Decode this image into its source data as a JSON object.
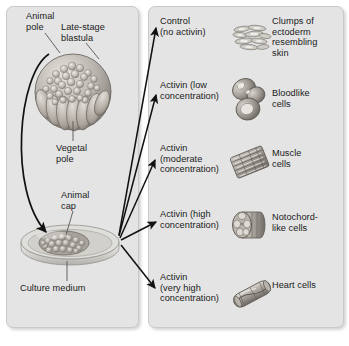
{
  "left_panel": {
    "labels": {
      "animal_pole": "Animal\npole",
      "blastula": "Late-stage\nblastula",
      "vegetal_pole": "Vegetal\npole",
      "animal_cap": "Animal\ncap",
      "culture_medium": "Culture medium"
    },
    "icons": {
      "blastula": "blastula-illustration",
      "dish": "culture-dish-illustration",
      "transfer_arrow": "curved-transfer-arrow"
    }
  },
  "right_panel": {
    "rows": [
      {
        "treatment": "Control\n(no activin)",
        "result": "Clumps of\nectoderm\nresembling\nskin",
        "cell_icon": "ectoderm-clump-illustration"
      },
      {
        "treatment": "Activin (low\nconcentration)",
        "result": "Bloodlike\ncells",
        "cell_icon": "bloodlike-cells-illustration"
      },
      {
        "treatment": "Activin\n(moderate\nconcentration)",
        "result": "Muscle\ncells",
        "cell_icon": "muscle-cells-illustration"
      },
      {
        "treatment": "Activin (high\nconcentration)",
        "result": "Notochord-\nlike cells",
        "cell_icon": "notochord-cells-illustration"
      },
      {
        "treatment": "Activin\n(very high\nconcentration)",
        "result": "Heart cells",
        "cell_icon": "heart-cells-illustration"
      }
    ]
  },
  "colors": {
    "panel_background": "#e4e4e4",
    "page_background": "#ffffff",
    "text": "#1a1a1a",
    "arrow": "#111111",
    "leader_line": "#555555",
    "tissue_light": "#d9d6d1",
    "tissue_mid": "#a9a49d",
    "tissue_dark": "#6e6a64"
  }
}
